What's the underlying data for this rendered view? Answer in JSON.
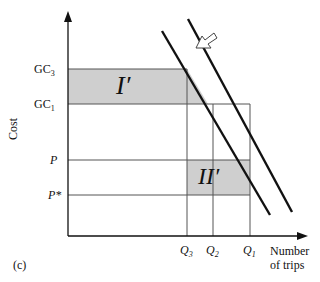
{
  "figure": {
    "panel_label": "(c)",
    "y_axis_label": "Cost",
    "x_axis_label_line1": "Number",
    "x_axis_label_line2": "of trips"
  },
  "y_ticks": {
    "gc3": {
      "base": "GC",
      "sub": "3"
    },
    "gc1": {
      "base": "GC",
      "sub": "1"
    },
    "p": "P",
    "p_star": "P*"
  },
  "x_ticks": {
    "q3": {
      "base": "Q",
      "sub": "3"
    },
    "q2": {
      "base": "Q",
      "sub": "2"
    },
    "q1": {
      "base": "Q",
      "sub": "1"
    }
  },
  "regions": {
    "region1": "I′",
    "region2": "II′"
  },
  "colors": {
    "shade": "#cfcfcf",
    "line": "#111111",
    "grid": "#555555"
  }
}
